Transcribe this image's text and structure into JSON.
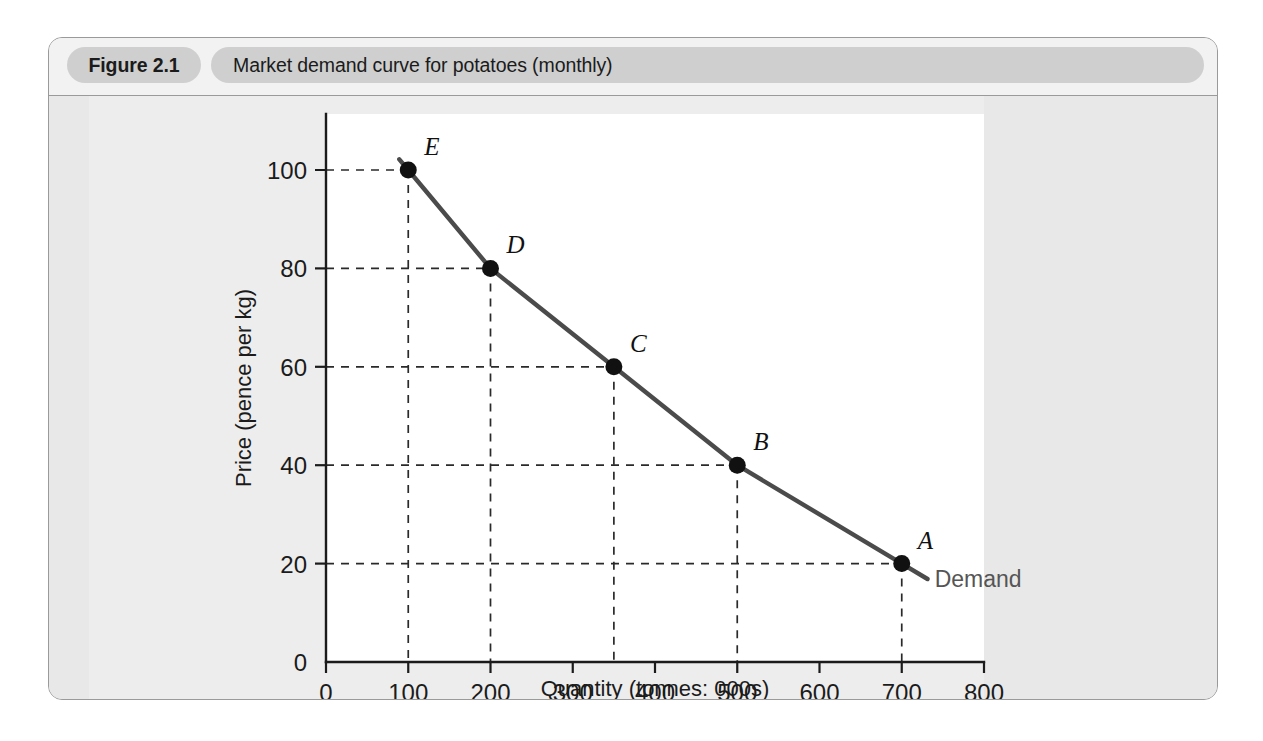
{
  "figure": {
    "number": "Figure 2.1",
    "title": "Market demand curve for potatoes (monthly)"
  },
  "chart_data": {
    "type": "line",
    "title": "Market demand curve for potatoes (monthly)",
    "xlabel": "Quantity (tonnes: 000s)",
    "ylabel": "Price (pence per kg)",
    "xlim": [
      0,
      800
    ],
    "ylim": [
      0,
      110
    ],
    "xticks": [
      "0",
      "100",
      "200",
      "300",
      "400",
      "500",
      "600",
      "700",
      "800"
    ],
    "xtick_values": [
      0,
      100,
      200,
      300,
      400,
      500,
      600,
      700,
      800
    ],
    "yticks": [
      "0",
      "20",
      "40",
      "60",
      "80",
      "100"
    ],
    "ytick_values": [
      0,
      20,
      40,
      60,
      80,
      100
    ],
    "grid": "dashed guide lines from each labelled point to both axes",
    "legend": "inline label at end of curve",
    "series": [
      {
        "name": "Demand",
        "x": [
          100,
          200,
          350,
          500,
          700
        ],
        "y": [
          100,
          80,
          60,
          40,
          20
        ]
      }
    ],
    "points": [
      {
        "label": "E",
        "x": 100,
        "y": 100
      },
      {
        "label": "D",
        "x": 200,
        "y": 80
      },
      {
        "label": "C",
        "x": 350,
        "y": 60
      },
      {
        "label": "B",
        "x": 500,
        "y": 40
      },
      {
        "label": "A",
        "x": 700,
        "y": 20
      }
    ],
    "annotations": [
      {
        "name": "curve-label",
        "text": "Demand",
        "x": 740,
        "y": 17
      }
    ]
  },
  "colors": {
    "panel_border": "#9a9a9a",
    "panel_background": "#e6e6e6",
    "caption_background": "#f2f2f2",
    "pill_background": "#cfcfcf",
    "plot_background": "#ffffff",
    "curve": "#4b4b4b",
    "point": "#111111",
    "axis": "#1b1b1b",
    "grid": "#2a2a2a",
    "demand_label": "#555555"
  }
}
